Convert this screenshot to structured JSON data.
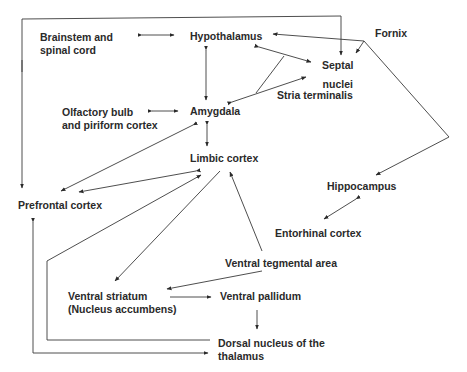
{
  "diagram": {
    "type": "brain-circuit-flow",
    "nodes": {
      "brainstem": "Brainstem and\nspinal cord",
      "hypothalamus": "Hypothalamus",
      "fornix": "Fornix",
      "septal_nuclei": "Septal\nnuclei",
      "stria_terminalis": "Stria terminalis",
      "olfactory": "Olfactory bulb\nand piriform cortex",
      "amygdala": "Amygdala",
      "limbic_cortex": "Limbic cortex",
      "prefrontal_cortex": "Prefrontal cortex",
      "hippocampus": "Hippocampus",
      "entorhinal_cortex": "Entorhinal cortex",
      "ventral_tegmental_area": "Ventral tegmental area",
      "ventral_striatum": "Ventral striatum\n(Nucleus accumbens)",
      "ventral_pallidum": "Ventral pallidum",
      "dorsal_nucleus_thalamus": "Dorsal nucleus of the\nthalamus"
    },
    "edges": [
      {
        "from": "Brainstem and spinal cord",
        "to": "Hypothalamus",
        "bidirectional": true
      },
      {
        "from": "Hypothalamus",
        "to": "Amygdala",
        "bidirectional": true
      },
      {
        "from": "Olfactory bulb and piriform cortex",
        "to": "Amygdala",
        "bidirectional": true
      },
      {
        "from": "Amygdala",
        "to": "Limbic cortex",
        "bidirectional": true
      },
      {
        "from": "Hypothalamus",
        "to": "Septal nuclei",
        "bidirectional": true,
        "via": "Stria terminalis"
      },
      {
        "from": "Amygdala",
        "to": "Septal nuclei",
        "bidirectional": true,
        "via": "Stria terminalis"
      },
      {
        "from": "Hippocampus",
        "to": "Hypothalamus",
        "via": "Fornix"
      },
      {
        "from": "Hippocampus",
        "to": "Septal nuclei",
        "via": "Fornix"
      },
      {
        "from": "Hypothalamus",
        "to": "Prefrontal cortex"
      },
      {
        "from": "Hypothalamus",
        "to": "Septal nuclei"
      },
      {
        "from": "Amygdala",
        "to": "Prefrontal cortex",
        "bidirectional": true
      },
      {
        "from": "Limbic cortex",
        "to": "Prefrontal cortex",
        "bidirectional": true
      },
      {
        "from": "Hippocampus",
        "to": "Entorhinal cortex",
        "bidirectional": true
      },
      {
        "from": "Limbic cortex",
        "to": "Ventral striatum (Nucleus accumbens)"
      },
      {
        "from": "Ventral tegmental area",
        "to": "Limbic cortex"
      },
      {
        "from": "Ventral tegmental area",
        "to": "Ventral striatum (Nucleus accumbens)"
      },
      {
        "from": "Ventral striatum (Nucleus accumbens)",
        "to": "Ventral pallidum"
      },
      {
        "from": "Ventral pallidum",
        "to": "Dorsal nucleus of the thalamus"
      },
      {
        "from": "Dorsal nucleus of the thalamus",
        "to": "Limbic cortex"
      },
      {
        "from": "Dorsal nucleus of the thalamus",
        "to": "Prefrontal cortex",
        "bidirectional": true
      }
    ]
  }
}
